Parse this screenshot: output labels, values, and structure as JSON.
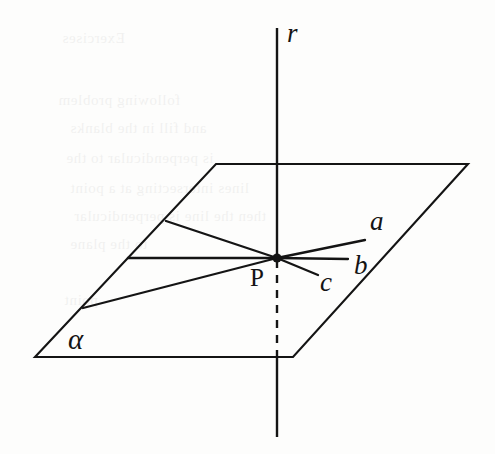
{
  "figure": {
    "kind": "geometry-diagram",
    "width": 495,
    "height": 454,
    "background_color": "#fdfdfc",
    "ink_color": "#141414"
  },
  "labels": {
    "line_r": "r",
    "line_a": "a",
    "line_b": "b",
    "line_c": "c",
    "point_p": "P",
    "plane_alpha": "α"
  },
  "geometry": {
    "plane": {
      "name": "plane-alpha",
      "label": "α",
      "corners": [
        [
          216,
          164
        ],
        [
          468,
          164
        ],
        [
          293,
          357
        ],
        [
          35,
          357
        ]
      ],
      "label_position": [
        78,
        340
      ]
    },
    "vertical_line": {
      "name": "line-r",
      "label": "r",
      "top_point": [
        277,
        28
      ],
      "intersection_point": [
        277,
        258
      ],
      "plane_exit_point": [
        277,
        357
      ],
      "bottom_point": [
        277,
        437
      ],
      "hidden_segment_dashed": true,
      "label_position": [
        287,
        32
      ]
    },
    "point": {
      "name": "point-P",
      "label": "P",
      "position": [
        277,
        258
      ],
      "label_position": [
        258,
        277
      ],
      "marker": "filled-dot"
    },
    "rays_in_plane": [
      {
        "name": "ray-a",
        "label": "a",
        "from": [
          277,
          258
        ],
        "to": [
          365,
          240
        ],
        "label_position": [
          372,
          222
        ]
      },
      {
        "name": "ray-b",
        "label": "b",
        "from": [
          277,
          258
        ],
        "to": [
          348,
          259
        ],
        "label_position": [
          355,
          265
        ]
      },
      {
        "name": "ray-c",
        "label": "c",
        "from": [
          277,
          258
        ],
        "to": [
          318,
          275
        ],
        "label_position": [
          322,
          282
        ]
      },
      {
        "name": "ray-upper-left",
        "label": "",
        "from": [
          277,
          258
        ],
        "to": [
          166,
          221
        ],
        "label_position": null
      },
      {
        "name": "ray-horizontal-left",
        "label": "",
        "from": [
          277,
          258
        ],
        "to": [
          128,
          258
        ],
        "label_position": null
      },
      {
        "name": "ray-lower-left",
        "label": "",
        "from": [
          277,
          258
        ],
        "to": [
          83,
          308
        ],
        "label_position": null
      }
    ]
  },
  "ghost_text": {
    "description": "faint mirrored show-through from the reverse page",
    "lines": [
      {
        "text": "Exercises",
        "x": 62,
        "y": 30
      },
      {
        "text": "following problem",
        "x": 58,
        "y": 92
      },
      {
        "text": "and fill in the blanks",
        "x": 70,
        "y": 120
      },
      {
        "text": "is perpendicular to the",
        "x": 66,
        "y": 150
      },
      {
        "text": "lines intersecting at a point",
        "x": 70,
        "y": 180
      },
      {
        "text": "then the line is perpendicular",
        "x": 74,
        "y": 208
      },
      {
        "text": "to the plane",
        "x": 70,
        "y": 236
      },
      {
        "text": "point",
        "x": 64,
        "y": 292
      }
    ]
  }
}
